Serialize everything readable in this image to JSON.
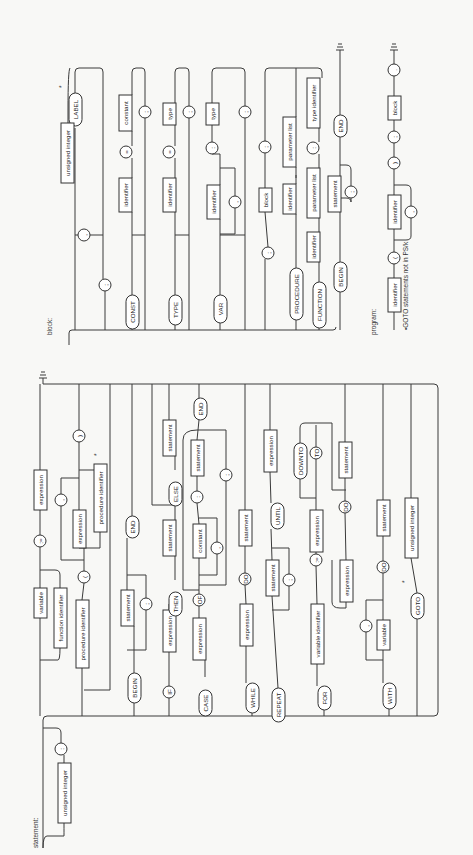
{
  "captions": {
    "statement": "statement:",
    "block": "block:",
    "program": "program:",
    "footnote": "•GOTO statements not in PS/k",
    "asterisk": "*"
  },
  "block_diagram": {
    "nodes": [
      {
        "id": "b1",
        "kind": "oval",
        "text": "LABEL",
        "x": 69,
        "y": 93,
        "w": 13,
        "h": 33
      },
      {
        "id": "b2",
        "kind": "rect",
        "text": "unsigned integer",
        "x": 61,
        "y": 123,
        "w": 13,
        "h": 60
      },
      {
        "id": "b3",
        "kind": "circle",
        "text": ",",
        "x": 84,
        "y": 235,
        "r": 6
      },
      {
        "id": "b4",
        "kind": "circle",
        "text": ";",
        "x": 105,
        "y": 285,
        "r": 6
      },
      {
        "id": "b5",
        "kind": "oval",
        "text": "CONST",
        "x": 126,
        "y": 295,
        "w": 13,
        "h": 34
      },
      {
        "id": "b6",
        "kind": "rect",
        "text": "identifier",
        "x": 119,
        "y": 178,
        "w": 13,
        "h": 34
      },
      {
        "id": "b7",
        "kind": "circle",
        "text": "=",
        "x": 126,
        "y": 152,
        "r": 6
      },
      {
        "id": "b8",
        "kind": "rect",
        "text": "constant",
        "x": 119,
        "y": 95,
        "w": 13,
        "h": 36
      },
      {
        "id": "b9",
        "kind": "circle",
        "text": ";",
        "x": 145,
        "y": 112,
        "r": 6
      },
      {
        "id": "b10",
        "kind": "oval",
        "text": "TYPE",
        "x": 169,
        "y": 295,
        "w": 13,
        "h": 30
      },
      {
        "id": "b11",
        "kind": "rect",
        "text": "identifier",
        "x": 163,
        "y": 178,
        "w": 13,
        "h": 34
      },
      {
        "id": "b12",
        "kind": "circle",
        "text": "=",
        "x": 169,
        "y": 152,
        "r": 6
      },
      {
        "id": "b13",
        "kind": "rect",
        "text": "type",
        "x": 163,
        "y": 103,
        "w": 13,
        "h": 22
      },
      {
        "id": "b14",
        "kind": "circle",
        "text": ";",
        "x": 189,
        "y": 112,
        "r": 6
      },
      {
        "id": "b15",
        "kind": "oval",
        "text": "VAR",
        "x": 214,
        "y": 295,
        "w": 13,
        "h": 28
      },
      {
        "id": "b16",
        "kind": "rect",
        "text": "identifier",
        "x": 207,
        "y": 185,
        "w": 13,
        "h": 34
      },
      {
        "id": "b17",
        "kind": "circle",
        "text": ",",
        "x": 235,
        "y": 202,
        "r": 6
      },
      {
        "id": "b18",
        "kind": "circle",
        "text": ":",
        "x": 212,
        "y": 148,
        "r": 6
      },
      {
        "id": "b19",
        "kind": "rect",
        "text": "type",
        "x": 206,
        "y": 103,
        "w": 13,
        "h": 22
      },
      {
        "id": "b20",
        "kind": "circle",
        "text": ";",
        "x": 245,
        "y": 112,
        "r": 6
      },
      {
        "id": "b21",
        "kind": "circle",
        "text": ";",
        "x": 265,
        "y": 147,
        "r": 6
      },
      {
        "id": "b22",
        "kind": "rect",
        "text": "block",
        "x": 259,
        "y": 188,
        "w": 13,
        "h": 24
      },
      {
        "id": "b23",
        "kind": "circle",
        "text": ";",
        "x": 268,
        "y": 253,
        "r": 6
      },
      {
        "id": "b24",
        "kind": "oval",
        "text": "PROCEDURE",
        "x": 290,
        "y": 268,
        "w": 13,
        "h": 52
      },
      {
        "id": "b25",
        "kind": "rect",
        "text": "identifier",
        "x": 283,
        "y": 184,
        "w": 13,
        "h": 30
      },
      {
        "id": "b26",
        "kind": "rect",
        "text": "parameter list",
        "x": 283,
        "y": 117,
        "w": 13,
        "h": 50
      },
      {
        "id": "b27",
        "kind": "oval",
        "text": "FUNCTION",
        "x": 313,
        "y": 282,
        "w": 13,
        "h": 46
      },
      {
        "id": "b28",
        "kind": "rect",
        "text": "identifier",
        "x": 307,
        "y": 232,
        "w": 13,
        "h": 30
      },
      {
        "id": "b29",
        "kind": "rect",
        "text": "parameter list",
        "x": 307,
        "y": 168,
        "w": 13,
        "h": 50
      },
      {
        "id": "b30",
        "kind": "circle",
        "text": ":",
        "x": 313,
        "y": 148,
        "r": 6
      },
      {
        "id": "b31",
        "kind": "rect",
        "text": "type identifier",
        "x": 307,
        "y": 78,
        "w": 13,
        "h": 50
      },
      {
        "id": "b32",
        "kind": "oval",
        "text": "BEGIN",
        "x": 334,
        "y": 262,
        "w": 13,
        "h": 30
      },
      {
        "id": "b33",
        "kind": "rect",
        "text": "statement",
        "x": 328,
        "y": 176,
        "w": 13,
        "h": 36
      },
      {
        "id": "b34",
        "kind": "circle",
        "text": ";",
        "x": 351,
        "y": 192,
        "r": 6
      },
      {
        "id": "b35",
        "kind": "oval",
        "text": "END",
        "x": 334,
        "y": 115,
        "w": 13,
        "h": 22
      }
    ]
  },
  "program_diagram": {
    "nodes": [
      {
        "id": "p1",
        "kind": "rect",
        "text": "identifier",
        "x": 388,
        "y": 278,
        "w": 13,
        "h": 34
      },
      {
        "id": "p2",
        "kind": "circle",
        "text": "(",
        "x": 394,
        "y": 258,
        "r": 6
      },
      {
        "id": "p3",
        "kind": "rect",
        "text": "identifier",
        "x": 388,
        "y": 195,
        "w": 13,
        "h": 34
      },
      {
        "id": "p4",
        "kind": "circle",
        "text": ",",
        "x": 411,
        "y": 212,
        "r": 6
      },
      {
        "id": "p5",
        "kind": "circle",
        "text": ")",
        "x": 394,
        "y": 163,
        "r": 6
      },
      {
        "id": "p6",
        "kind": "circle",
        "text": ";",
        "x": 394,
        "y": 137,
        "r": 6
      },
      {
        "id": "p7",
        "kind": "rect",
        "text": "block",
        "x": 388,
        "y": 96,
        "w": 13,
        "h": 24
      },
      {
        "id": "p8",
        "kind": "circle",
        "text": ".",
        "x": 394,
        "y": 70,
        "r": 6
      }
    ]
  },
  "statement_diagram": {
    "nodes": [
      {
        "id": "s1",
        "kind": "rect",
        "text": "unsigned integer",
        "x": 58,
        "y": 763,
        "w": 13,
        "h": 60
      },
      {
        "id": "s2",
        "kind": "circle",
        "text": ":",
        "x": 61,
        "y": 749,
        "r": 6
      },
      {
        "id": "s3",
        "kind": "rect",
        "text": "variable",
        "x": 34,
        "y": 588,
        "w": 13,
        "h": 30
      },
      {
        "id": "s4",
        "kind": "rect",
        "text": "function identifier",
        "x": 54,
        "y": 588,
        "w": 13,
        "h": 60
      },
      {
        "id": "s5",
        "kind": "circle",
        "text": ":=",
        "x": 40,
        "y": 541,
        "r": 6
      },
      {
        "id": "s6",
        "kind": "rect",
        "text": "expression",
        "x": 34,
        "y": 470,
        "w": 13,
        "h": 40
      },
      {
        "id": "s7",
        "kind": "rect",
        "text": "procedure identifier",
        "x": 76,
        "y": 600,
        "w": 13,
        "h": 68
      },
      {
        "id": "s8",
        "kind": "circle",
        "text": "(",
        "x": 84,
        "y": 577,
        "r": 6
      },
      {
        "id": "s9",
        "kind": "rect",
        "text": "expression",
        "x": 73,
        "y": 510,
        "w": 13,
        "h": 38
      },
      {
        "id": "s10",
        "kind": "circle",
        "text": ",",
        "x": 61,
        "y": 500,
        "r": 6
      },
      {
        "id": "s11",
        "kind": "rect",
        "text": "procedure identifier",
        "x": 94,
        "y": 464,
        "w": 13,
        "h": 68
      },
      {
        "id": "s12",
        "kind": "circle",
        "text": ")",
        "x": 79,
        "y": 436,
        "r": 6
      },
      {
        "id": "s13",
        "kind": "oval",
        "text": "BEGIN",
        "x": 128,
        "y": 673,
        "w": 13,
        "h": 30
      },
      {
        "id": "s14",
        "kind": "rect",
        "text": "statement",
        "x": 121,
        "y": 590,
        "w": 13,
        "h": 36
      },
      {
        "id": "s15",
        "kind": "circle",
        "text": ";",
        "x": 146,
        "y": 604,
        "r": 6
      },
      {
        "id": "s16",
        "kind": "oval",
        "text": "END",
        "x": 126,
        "y": 516,
        "w": 13,
        "h": 22
      },
      {
        "id": "s17",
        "kind": "circle",
        "text": "IF",
        "x": 169,
        "y": 692,
        "r": 6
      },
      {
        "id": "s18",
        "kind": "rect",
        "text": "expression",
        "x": 163,
        "y": 610,
        "w": 13,
        "h": 42
      },
      {
        "id": "s19",
        "kind": "oval",
        "text": "THEN",
        "x": 169,
        "y": 592,
        "w": 13,
        "h": 24
      },
      {
        "id": "s20",
        "kind": "rect",
        "text": "statement",
        "x": 163,
        "y": 520,
        "w": 13,
        "h": 36
      },
      {
        "id": "s21",
        "kind": "oval",
        "text": "ELSE",
        "x": 169,
        "y": 482,
        "w": 13,
        "h": 24
      },
      {
        "id": "s22",
        "kind": "rect",
        "text": "statement",
        "x": 163,
        "y": 420,
        "w": 13,
        "h": 36
      },
      {
        "id": "s23",
        "kind": "oval",
        "text": "CASE",
        "x": 199,
        "y": 690,
        "w": 13,
        "h": 26
      },
      {
        "id": "s24",
        "kind": "rect",
        "text": "expression",
        "x": 193,
        "y": 618,
        "w": 13,
        "h": 42
      },
      {
        "id": "s25",
        "kind": "circle",
        "text": "OF",
        "x": 199,
        "y": 600,
        "r": 6
      },
      {
        "id": "s26",
        "kind": "rect",
        "text": "constant",
        "x": 193,
        "y": 524,
        "w": 13,
        "h": 34
      },
      {
        "id": "s27",
        "kind": "circle",
        "text": ",",
        "x": 217,
        "y": 548,
        "r": 6
      },
      {
        "id": "s28",
        "kind": "circle",
        "text": ":",
        "x": 197,
        "y": 497,
        "r": 6
      },
      {
        "id": "s29",
        "kind": "rect",
        "text": "statement",
        "x": 191,
        "y": 440,
        "w": 13,
        "h": 36
      },
      {
        "id": "s30",
        "kind": "circle",
        "text": ";",
        "x": 226,
        "y": 475,
        "r": 6
      },
      {
        "id": "s31",
        "kind": "oval",
        "text": "END",
        "x": 194,
        "y": 398,
        "w": 13,
        "h": 22
      },
      {
        "id": "s32",
        "kind": "oval",
        "text": "WHILE",
        "x": 246,
        "y": 683,
        "w": 13,
        "h": 30
      },
      {
        "id": "s33",
        "kind": "rect",
        "text": "expression",
        "x": 240,
        "y": 604,
        "w": 13,
        "h": 42
      },
      {
        "id": "s34",
        "kind": "circle",
        "text": "DO",
        "x": 245,
        "y": 579,
        "r": 6
      },
      {
        "id": "s35",
        "kind": "rect",
        "text": "statement",
        "x": 239,
        "y": 510,
        "w": 13,
        "h": 36
      },
      {
        "id": "s36",
        "kind": "oval",
        "text": "REPEAT",
        "x": 272,
        "y": 688,
        "w": 13,
        "h": 34
      },
      {
        "id": "s37",
        "kind": "rect",
        "text": "statement",
        "x": 266,
        "y": 560,
        "w": 13,
        "h": 36
      },
      {
        "id": "s38",
        "kind": "circle",
        "text": ";",
        "x": 289,
        "y": 580,
        "r": 6
      },
      {
        "id": "s39",
        "kind": "oval",
        "text": "UNTIL",
        "x": 271,
        "y": 503,
        "w": 13,
        "h": 26
      },
      {
        "id": "s40",
        "kind": "rect",
        "text": "expression",
        "x": 264,
        "y": 430,
        "w": 13,
        "h": 42
      },
      {
        "id": "s41",
        "kind": "oval",
        "text": "FOR",
        "x": 318,
        "y": 686,
        "w": 13,
        "h": 24
      },
      {
        "id": "s42",
        "kind": "rect",
        "text": "variable identifier",
        "x": 311,
        "y": 604,
        "w": 13,
        "h": 60
      },
      {
        "id": "s43",
        "kind": "circle",
        "text": ":=",
        "x": 316,
        "y": 560,
        "r": 6
      },
      {
        "id": "s44",
        "kind": "rect",
        "text": "expression",
        "x": 310,
        "y": 510,
        "w": 13,
        "h": 42
      },
      {
        "id": "s45",
        "kind": "oval",
        "text": "DOWNTO",
        "x": 294,
        "y": 443,
        "w": 13,
        "h": 36
      },
      {
        "id": "s46",
        "kind": "circle",
        "text": "TO",
        "x": 316,
        "y": 453,
        "r": 6
      },
      {
        "id": "s47",
        "kind": "rect",
        "text": "expression",
        "x": 340,
        "y": 560,
        "w": 13,
        "h": 42
      },
      {
        "id": "s48",
        "kind": "circle",
        "text": "DO",
        "x": 345,
        "y": 507,
        "r": 6
      },
      {
        "id": "s49",
        "kind": "rect",
        "text": "statement",
        "x": 339,
        "y": 442,
        "w": 13,
        "h": 36
      },
      {
        "id": "s50",
        "kind": "oval",
        "text": "WITH",
        "x": 383,
        "y": 683,
        "w": 13,
        "h": 26
      },
      {
        "id": "s51",
        "kind": "rect",
        "text": "variable",
        "x": 377,
        "y": 620,
        "w": 13,
        "h": 30
      },
      {
        "id": "s52",
        "kind": "circle",
        "text": ",",
        "x": 366,
        "y": 626,
        "r": 6
      },
      {
        "id": "s53",
        "kind": "circle",
        "text": "DO",
        "x": 383,
        "y": 567,
        "r": 6
      },
      {
        "id": "s54",
        "kind": "rect",
        "text": "statement",
        "x": 377,
        "y": 500,
        "w": 13,
        "h": 36
      },
      {
        "id": "s55",
        "kind": "oval",
        "text": "GOTO",
        "x": 411,
        "y": 593,
        "w": 13,
        "h": 26
      },
      {
        "id": "s56",
        "kind": "rect",
        "text": "unsigned integer",
        "x": 405,
        "y": 498,
        "w": 13,
        "h": 60
      }
    ]
  }
}
